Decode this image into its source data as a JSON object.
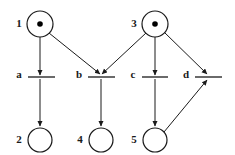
{
  "diagram": {
    "type": "petri-net",
    "title": "",
    "stroke_color": "#1a1a1a",
    "fill_color": "#ffffff",
    "token_color": "#000000",
    "places": [
      {
        "id": "p1",
        "label": "1",
        "cx": 40,
        "cy": 24,
        "r": 13,
        "tokens": 1,
        "label_x": 19,
        "label_y": 24
      },
      {
        "id": "p3",
        "label": "3",
        "cx": 155,
        "cy": 24,
        "r": 13,
        "tokens": 1,
        "label_x": 134,
        "label_y": 24
      },
      {
        "id": "p2",
        "label": "2",
        "cx": 40,
        "cy": 140,
        "r": 12,
        "tokens": 0,
        "label_x": 19,
        "label_y": 140
      },
      {
        "id": "p4",
        "label": "4",
        "cx": 101,
        "cy": 140,
        "r": 12,
        "tokens": 0,
        "label_x": 80,
        "label_y": 140
      },
      {
        "id": "p5",
        "label": "5",
        "cx": 155,
        "cy": 140,
        "r": 12,
        "tokens": 0,
        "label_x": 134,
        "label_y": 140
      }
    ],
    "transitions": [
      {
        "id": "ta",
        "label": "a",
        "x1": 28,
        "x2": 55,
        "y": 77,
        "label_x": 19,
        "label_y": 75
      },
      {
        "id": "tb",
        "label": "b",
        "x1": 88,
        "x2": 115,
        "y": 77,
        "label_x": 79,
        "label_y": 75
      },
      {
        "id": "tc",
        "label": "c",
        "x1": 142,
        "x2": 168,
        "y": 77,
        "label_x": 133,
        "label_y": 75
      },
      {
        "id": "td",
        "label": "d",
        "x1": 195,
        "x2": 222,
        "y": 77,
        "label_x": 186,
        "label_y": 75
      }
    ],
    "arcs": [
      {
        "id": "a1",
        "from": "p1",
        "to": "ta",
        "points": "40,37 40,75"
      },
      {
        "id": "a2",
        "from": "p1",
        "to": "tb",
        "points": "49,33 100,74"
      },
      {
        "id": "a3",
        "from": "p3",
        "to": "tb",
        "points": "146,33 102,74"
      },
      {
        "id": "a4",
        "from": "p3",
        "to": "tc",
        "points": "155,37 155,75"
      },
      {
        "id": "a5",
        "from": "p3",
        "to": "td",
        "points": "164,32 207,74"
      },
      {
        "id": "a6",
        "from": "ta",
        "to": "p2",
        "points": "40,79 40,126"
      },
      {
        "id": "a7",
        "from": "tb",
        "to": "p4",
        "points": "101,79 101,126"
      },
      {
        "id": "a8",
        "from": "tc",
        "to": "p5",
        "points": "155,79 155,126"
      },
      {
        "id": "a9",
        "from": "p5",
        "to": "td",
        "points": "164,132 207,80"
      }
    ]
  }
}
